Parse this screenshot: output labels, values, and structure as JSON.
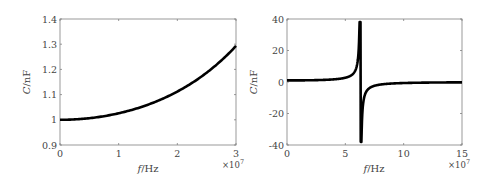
{
  "chart_data": [
    {
      "type": "line",
      "title": "",
      "xlabel": "f/Hz",
      "ylabel": "C/nF",
      "x_multiplier": "×10^7",
      "xlim": [
        0,
        3
      ],
      "ylim": [
        0.9,
        1.4
      ],
      "xticks": [
        "0",
        "1",
        "2",
        "3"
      ],
      "yticks": [
        "0.9",
        "1",
        "1.1",
        "1.2",
        "1.3",
        "1.4"
      ],
      "grid": false,
      "legend": null,
      "series": [
        {
          "name": "C(f)",
          "x": [
            0,
            0.5,
            1,
            1.5,
            2,
            2.5,
            3
          ],
          "values": [
            1.0,
            1.006,
            1.026,
            1.06,
            1.112,
            1.188,
            1.293
          ]
        }
      ]
    },
    {
      "type": "line",
      "title": "",
      "xlabel": "f/Hz",
      "ylabel": "C/nF",
      "x_multiplier": "×10^7",
      "xlim": [
        0,
        15
      ],
      "ylim": [
        -40,
        40
      ],
      "xticks": [
        "0",
        "5",
        "10",
        "15"
      ],
      "yticks": [
        "-40",
        "-20",
        "0",
        "20",
        "40"
      ],
      "grid": false,
      "legend": null,
      "annotations": [
        "resonance near f ≈ 6.3×10^7 Hz"
      ],
      "series": [
        {
          "name": "C(f)",
          "x": [
            0,
            2,
            4,
            5,
            5.8,
            6.2,
            6.3,
            6.4,
            6.8,
            8,
            10,
            12,
            15
          ],
          "values": [
            1.0,
            1.11,
            1.68,
            2.7,
            6.4,
            38,
            38,
            -38,
            -6.7,
            -1.6,
            -0.66,
            -0.38,
            -0.21
          ]
        }
      ]
    }
  ],
  "plots": {
    "left": {
      "ylabel_c": "C",
      "ylabel_unit": "/nF",
      "xlabel_f": "f",
      "xlabel_unit": "/Hz",
      "exp_base": "×10",
      "exp_pow": "7",
      "xticks": [
        "0",
        "1",
        "2",
        "3"
      ],
      "yticks": [
        "0.9",
        "1",
        "1.1",
        "1.2",
        "1.3",
        "1.4"
      ]
    },
    "right": {
      "ylabel_c": "C",
      "ylabel_unit": "/nF",
      "xlabel_f": "f",
      "xlabel_unit": "/Hz",
      "exp_base": "×10",
      "exp_pow": "7",
      "xticks": [
        "0",
        "5",
        "10",
        "15"
      ],
      "yticks": [
        "-40",
        "-20",
        "0",
        "20",
        "40"
      ]
    }
  },
  "colors": {
    "line": "#000000",
    "axes": "#808080",
    "text": "#444444"
  }
}
